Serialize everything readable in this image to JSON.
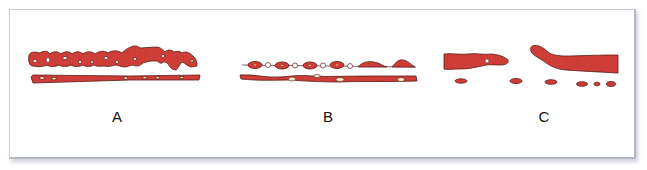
{
  "figure": {
    "panels": [
      {
        "id": "A",
        "label": "A",
        "label_x": 117,
        "label_y": 108
      },
      {
        "id": "B",
        "label": "B",
        "label_x": 328,
        "label_y": 108
      },
      {
        "id": "C",
        "label": "C",
        "label_x": 544,
        "label_y": 108
      }
    ],
    "colors": {
      "fill": "#cf3f38",
      "outline": "#5a1a16",
      "frame_border": "#c9ccd6",
      "background": "#ffffff"
    }
  }
}
